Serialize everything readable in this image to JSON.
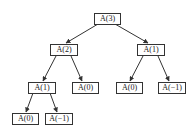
{
  "diagram": {
    "type": "recursion-tree",
    "nodes": [
      {
        "id": "n0",
        "label": "A(3)",
        "x": 94,
        "y": 13,
        "w": 25
      },
      {
        "id": "n1",
        "label": "A(2)",
        "x": 50,
        "y": 44,
        "w": 26
      },
      {
        "id": "n2",
        "label": "A(1)",
        "x": 137,
        "y": 44,
        "w": 26
      },
      {
        "id": "n3",
        "label": "A(1)",
        "x": 28,
        "y": 82,
        "w": 26
      },
      {
        "id": "n4",
        "label": "A(0)",
        "x": 72,
        "y": 82,
        "w": 25
      },
      {
        "id": "n5",
        "label": "A(0)",
        "x": 116,
        "y": 82,
        "w": 25
      },
      {
        "id": "n6",
        "label": "A(−1)",
        "x": 158,
        "y": 82,
        "w": 26
      },
      {
        "id": "n7",
        "label": "A(0)",
        "x": 12,
        "y": 113,
        "w": 25
      },
      {
        "id": "n8",
        "label": "A(−1)",
        "x": 45,
        "y": 113,
        "w": 26
      }
    ],
    "edges": [
      {
        "from": "n0",
        "to": "n1",
        "x1": 98,
        "y1": 24,
        "x2": 66,
        "y2": 43
      },
      {
        "from": "n0",
        "to": "n2",
        "x1": 115,
        "y1": 24,
        "x2": 148,
        "y2": 43
      },
      {
        "from": "n1",
        "to": "n3",
        "x1": 56,
        "y1": 56,
        "x2": 43,
        "y2": 81
      },
      {
        "from": "n1",
        "to": "n4",
        "x1": 71,
        "y1": 56,
        "x2": 82,
        "y2": 81
      },
      {
        "from": "n2",
        "to": "n5",
        "x1": 143,
        "y1": 56,
        "x2": 130,
        "y2": 81
      },
      {
        "from": "n2",
        "to": "n6",
        "x1": 158,
        "y1": 56,
        "x2": 169,
        "y2": 81
      },
      {
        "from": "n3",
        "to": "n7",
        "x1": 33,
        "y1": 93,
        "x2": 26,
        "y2": 112
      },
      {
        "from": "n3",
        "to": "n8",
        "x1": 50,
        "y1": 93,
        "x2": 57,
        "y2": 112
      }
    ],
    "colors": {
      "stroke": "#333333",
      "text": "#222222",
      "background": "#ffffff"
    }
  }
}
